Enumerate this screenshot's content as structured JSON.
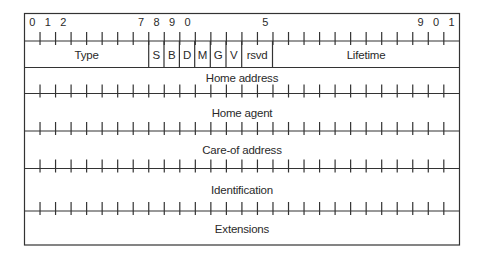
{
  "diagram": {
    "type": "packet-format",
    "colors": {
      "line": "#333333",
      "text": "#2a2a2a",
      "background": "#ffffff"
    },
    "bit_labels": [
      {
        "text": "0",
        "bit": 0
      },
      {
        "text": "1",
        "bit": 1
      },
      {
        "text": "2",
        "bit": 2
      },
      {
        "text": "7",
        "bit": 7
      },
      {
        "text": "8",
        "bit": 8
      },
      {
        "text": "9",
        "bit": 9
      },
      {
        "text": "0",
        "bit": 10
      },
      {
        "text": "5",
        "bit": 15
      },
      {
        "text": "9",
        "bit": 25
      },
      {
        "text": "0",
        "bit": 26
      },
      {
        "text": "1",
        "bit": 27
      }
    ],
    "header_fields": [
      {
        "label": "Type",
        "name": "field-type"
      },
      {
        "label": "S",
        "name": "field-s-flag"
      },
      {
        "label": "B",
        "name": "field-b-flag"
      },
      {
        "label": "D",
        "name": "field-d-flag"
      },
      {
        "label": "M",
        "name": "field-m-flag"
      },
      {
        "label": "G",
        "name": "field-g-flag"
      },
      {
        "label": "V",
        "name": "field-v-flag"
      },
      {
        "label": "rsvd",
        "name": "field-rsvd"
      },
      {
        "label": "Lifetime",
        "name": "field-lifetime"
      }
    ],
    "rows": [
      {
        "label": "Home address",
        "name": "field-home-address"
      },
      {
        "label": "Home agent",
        "name": "field-home-agent"
      },
      {
        "label": "Care-of address",
        "name": "field-care-of-address"
      },
      {
        "label": "Identification",
        "name": "field-identification"
      },
      {
        "label": "Extensions",
        "name": "field-extensions"
      }
    ]
  }
}
